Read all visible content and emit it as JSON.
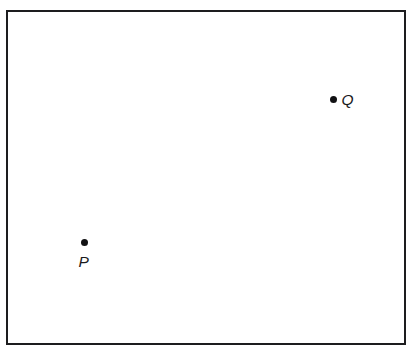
{
  "figure": {
    "background_color": "#ffffff",
    "frame": {
      "name": "rectangular-border",
      "stroke_color": "#1d1d1f",
      "stroke_width_px": 2.5,
      "left_px": 6,
      "top_px": 10,
      "width_px": 400,
      "height_px": 335
    }
  },
  "chart_data": {
    "type": "scatter",
    "title": "",
    "subtitle": "",
    "xlabel": "",
    "ylabel": "",
    "grid": false,
    "legend": null,
    "axis_ticks": [],
    "xlim": [
      6,
      406
    ],
    "ylim": [
      10,
      345
    ],
    "marker": {
      "shape": "circle",
      "filled": true,
      "color": "#111113",
      "size_px": 7.5
    },
    "points": [
      {
        "label": "P",
        "x_px": 85,
        "y_px": 243,
        "label_position": "below",
        "label_offset_px": [
          -6,
          11
        ],
        "label_style": "italic"
      },
      {
        "label": "Q",
        "x_px": 334,
        "y_px": 100,
        "label_position": "right",
        "label_offset_px": [
          8,
          -8
        ],
        "label_style": "italic"
      }
    ],
    "annotations": [],
    "colors": {
      "point": "#111113",
      "border": "#1d1d1f",
      "background": "#ffffff",
      "label_text": "#1a1a1c"
    }
  },
  "labels": {
    "point_p": "P",
    "point_q": "Q"
  }
}
